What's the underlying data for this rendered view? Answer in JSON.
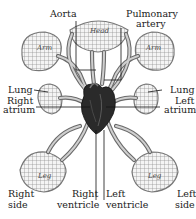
{
  "labels": {
    "aorta": "Aorta",
    "pulmonary_artery_line1": "Pulmonary",
    "pulmonary_artery_line2": "artery",
    "lung_left_side": "Lung",
    "lung_right_side": "Lung",
    "right_atrium_line1": "Right",
    "right_atrium_line2": "atrium",
    "left_atrium_line1": "Left",
    "left_atrium_line2": "atrium",
    "right_side_line1": "Right",
    "right_side_line2": "side",
    "left_side_line1": "Left",
    "left_side_line2": "side",
    "right_ventricle_line1": "Right",
    "right_ventricle_line2": "ventricle",
    "left_ventricle_line1": "Left",
    "left_ventricle_line2": "ventricle"
  },
  "organs": {
    "head": "Head",
    "arm_left": "Arm",
    "arm_right": "Arm",
    "leg_left": "Leg",
    "leg_right": "Leg"
  },
  "colors": {
    "vessel": "#6a6a6a",
    "heart": "#2a2a2a",
    "mesh": "#8a8a8a",
    "text": "#222222"
  }
}
